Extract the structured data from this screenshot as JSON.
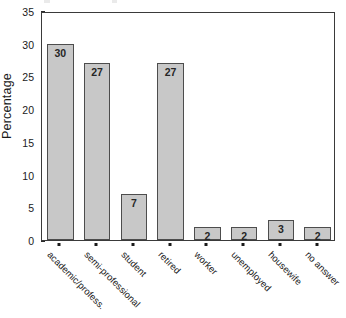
{
  "chart_data": {
    "type": "bar",
    "title": "",
    "subtitle": "",
    "xlabel": "",
    "ylabel": "Percentage",
    "categories": [
      "academic/profess.",
      "semi-professional",
      "student",
      "retired",
      "worker",
      "unemployed",
      "housewife",
      "no answer"
    ],
    "values": [
      30,
      27,
      7,
      27,
      2,
      2,
      3,
      2
    ],
    "data_labels": [
      "30",
      "27",
      "7",
      "27",
      "2",
      "2",
      "3",
      "2"
    ],
    "ylim": [
      0,
      35
    ],
    "ytick_values": [
      0,
      5,
      10,
      15,
      20,
      25,
      30,
      35
    ],
    "ytick_labels": [
      "0",
      "5",
      "10",
      "15",
      "20",
      "25",
      "30",
      "35"
    ],
    "grid": false,
    "legend": null,
    "legend_position": "none",
    "bar_fill_color": "#c8c8c8",
    "bar_border_color": "#4d4d4d",
    "axis_color": "#3a3a3a",
    "text_color": "#1a1a1a",
    "background_color": "#ffffff",
    "xtick_label_rotation": 45,
    "data_label_position": "inside-top"
  }
}
